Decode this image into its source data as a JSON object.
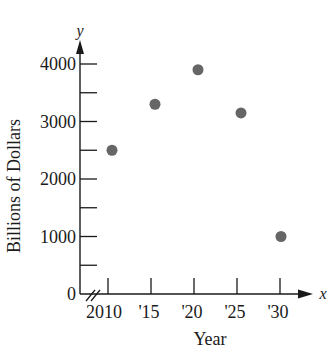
{
  "chart_data": {
    "type": "scatter",
    "title": "",
    "xlabel": "Year",
    "ylabel": "Billions of Dollars",
    "x_axis_var": "x",
    "y_axis_var": "y",
    "x_tick_labels": [
      "2010",
      "'15",
      "'20",
      "'25",
      "'30"
    ],
    "x_ticks": [
      2010,
      2015,
      2020,
      2025,
      2030
    ],
    "y_tick_labels": [
      "0",
      "1000",
      "2000",
      "3000",
      "4000"
    ],
    "y_ticks": [
      0,
      1000,
      2000,
      3000,
      4000
    ],
    "y_minor_ticks": [
      500,
      1500,
      2500,
      3500
    ],
    "xlim": [
      2005,
      2035
    ],
    "ylim": [
      0,
      4300
    ],
    "x_axis_break": true,
    "grid": false,
    "legend": null,
    "point_color": "#666666",
    "x": [
      2010,
      2015,
      2020,
      2025,
      2030
    ],
    "values": [
      2500,
      3300,
      3900,
      3150,
      1000
    ]
  }
}
